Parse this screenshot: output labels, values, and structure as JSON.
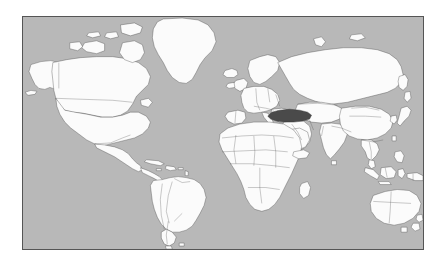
{
  "map": {
    "title": "World locator map",
    "type": "world-locator",
    "projection": "equirectangular",
    "colors": {
      "ocean": "#b8b8b8",
      "land": "#fbfbfb",
      "coastline": "#3a3a3a",
      "country_border": "#4a4a4a",
      "highlight_fill": "#4a4a4a",
      "frame_border": "#555555",
      "page_background": "#ffffff"
    },
    "frame": {
      "left": 22,
      "top": 16,
      "width": 402,
      "height": 234,
      "border_width": 1
    },
    "highlighted_country": {
      "name": "Turkey",
      "region": "Anatolia / Western Asia",
      "fill": "#4a4a4a"
    },
    "visible_landmasses": [
      "North America",
      "South America",
      "Greenland",
      "Europe",
      "Africa",
      "Asia",
      "Australia",
      "New Zealand",
      "Iceland",
      "Madagascar",
      "Japan",
      "Indonesia",
      "Philippines",
      "British Isles",
      "Sri Lanka",
      "New Guinea"
    ],
    "features": {
      "country_borders_shown": true,
      "graticule_shown": false,
      "labels_shown": false,
      "legend_shown": false,
      "antarctica_shown": false
    }
  }
}
